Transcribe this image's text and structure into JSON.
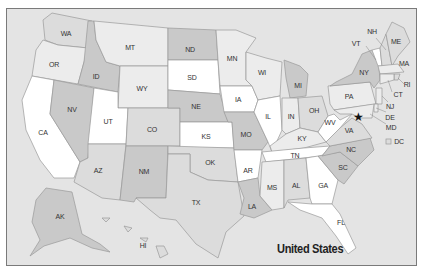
{
  "map": {
    "title": "United States",
    "colors": {
      "background": "#e4e4e4",
      "dark": "#c9c9c9",
      "medium": "#dcdcdc",
      "light": "#ececec",
      "white": "#ffffff",
      "border": "#9a9a9a"
    },
    "capital_marker": "star-icon",
    "states": [
      {
        "abbr": "WA"
      },
      {
        "abbr": "OR"
      },
      {
        "abbr": "CA"
      },
      {
        "abbr": "ID"
      },
      {
        "abbr": "NV"
      },
      {
        "abbr": "MT"
      },
      {
        "abbr": "WY"
      },
      {
        "abbr": "UT"
      },
      {
        "abbr": "AZ"
      },
      {
        "abbr": "CO"
      },
      {
        "abbr": "NM"
      },
      {
        "abbr": "ND"
      },
      {
        "abbr": "SD"
      },
      {
        "abbr": "NE"
      },
      {
        "abbr": "KS"
      },
      {
        "abbr": "OK"
      },
      {
        "abbr": "TX"
      },
      {
        "abbr": "MN"
      },
      {
        "abbr": "IA"
      },
      {
        "abbr": "MO"
      },
      {
        "abbr": "AR"
      },
      {
        "abbr": "LA"
      },
      {
        "abbr": "WI"
      },
      {
        "abbr": "IL"
      },
      {
        "abbr": "MI"
      },
      {
        "abbr": "IN"
      },
      {
        "abbr": "OH"
      },
      {
        "abbr": "KY"
      },
      {
        "abbr": "TN"
      },
      {
        "abbr": "MS"
      },
      {
        "abbr": "AL"
      },
      {
        "abbr": "GA"
      },
      {
        "abbr": "FL"
      },
      {
        "abbr": "SC"
      },
      {
        "abbr": "NC"
      },
      {
        "abbr": "VA"
      },
      {
        "abbr": "WV"
      },
      {
        "abbr": "PA"
      },
      {
        "abbr": "NY"
      },
      {
        "abbr": "VT"
      },
      {
        "abbr": "NH"
      },
      {
        "abbr": "ME"
      },
      {
        "abbr": "MA"
      },
      {
        "abbr": "RI"
      },
      {
        "abbr": "CT"
      },
      {
        "abbr": "NJ"
      },
      {
        "abbr": "DE"
      },
      {
        "abbr": "MD"
      },
      {
        "abbr": "DC"
      },
      {
        "abbr": "AK"
      },
      {
        "abbr": "HI"
      }
    ]
  }
}
